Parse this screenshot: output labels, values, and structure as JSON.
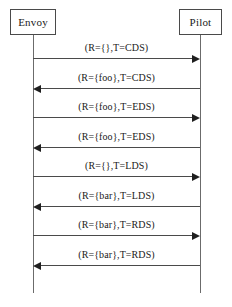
{
  "diagram": {
    "type": "uml-sequence-diagram",
    "width": 232,
    "height": 307,
    "colors": {
      "background": "#ffffff",
      "box_border": "#4a4a4a",
      "lifeline": "#6b6b6b",
      "message_line": "#4a4a4a",
      "arrowhead": "#1f1f1f",
      "text": "#1a1a1a"
    }
  },
  "participants": [
    {
      "id": "envoy",
      "label": "Envoy",
      "x": 33,
      "box_left": 10,
      "box_top": 9,
      "box_width": 46,
      "box_height": 26
    },
    {
      "id": "pilot",
      "label": "Pilot",
      "x": 200,
      "box_left": 179,
      "box_top": 9,
      "box_width": 43,
      "box_height": 26
    }
  ],
  "lifelines": {
    "top": 35,
    "bottom": 293
  },
  "messages": [
    {
      "index": 1,
      "label": "(R={},T=CDS)",
      "from": "envoy",
      "to": "pilot",
      "direction": "right",
      "y": 58,
      "label_y": 42
    },
    {
      "index": 2,
      "label": "(R={foo},T=CDS)",
      "from": "pilot",
      "to": "envoy",
      "direction": "left",
      "y": 88,
      "label_y": 72
    },
    {
      "index": 3,
      "label": "(R={foo},T=EDS)",
      "from": "envoy",
      "to": "pilot",
      "direction": "right",
      "y": 117,
      "label_y": 101
    },
    {
      "index": 4,
      "label": "(R={foo},T=EDS)",
      "from": "pilot",
      "to": "envoy",
      "direction": "left",
      "y": 147,
      "label_y": 131
    },
    {
      "index": 5,
      "label": "(R={},T=LDS)",
      "from": "envoy",
      "to": "pilot",
      "direction": "right",
      "y": 176,
      "label_y": 160
    },
    {
      "index": 6,
      "label": "(R={bar},T=LDS)",
      "from": "pilot",
      "to": "envoy",
      "direction": "left",
      "y": 206,
      "label_y": 190
    },
    {
      "index": 7,
      "label": "(R={bar},T=RDS)",
      "from": "envoy",
      "to": "pilot",
      "direction": "right",
      "y": 235,
      "label_y": 219
    },
    {
      "index": 8,
      "label": "(R={bar},T=RDS)",
      "from": "pilot",
      "to": "envoy",
      "direction": "left",
      "y": 265,
      "label_y": 249
    }
  ]
}
